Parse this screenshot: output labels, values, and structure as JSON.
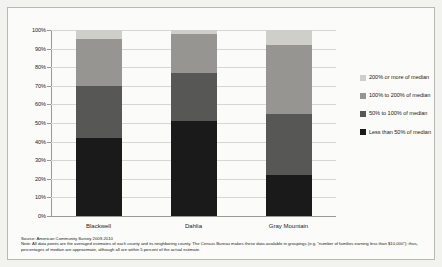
{
  "chart_data": {
    "type": "bar",
    "subtype": "stacked-bar-100-percent",
    "title": "",
    "xlabel": "",
    "ylabel": "",
    "ylim": [
      0,
      100
    ],
    "grid": true,
    "legend_position": "right",
    "categories": [
      "Blackwell",
      "Dahlia",
      "Gray Mountain"
    ],
    "tick_labels": [
      "0%",
      "10%",
      "20%",
      "30%",
      "40%",
      "50%",
      "60%",
      "70%",
      "80%",
      "90%",
      "100%"
    ],
    "tick_values": [
      0,
      10,
      20,
      30,
      40,
      50,
      60,
      70,
      80,
      90,
      100
    ],
    "series": [
      {
        "name": "Less than 50% of median",
        "color": "#1a1a1a",
        "values": [
          42,
          51,
          22
        ]
      },
      {
        "name": "50% to 100% of median",
        "color": "#575756",
        "values": [
          28,
          26,
          33
        ]
      },
      {
        "name": "100% to 200% of median",
        "color": "#969591",
        "values": [
          25,
          21,
          37
        ]
      },
      {
        "name": "200% or more of median",
        "color": "#cfcfca",
        "values": [
          5,
          2,
          8
        ]
      }
    ]
  },
  "legend": {
    "items": [
      {
        "label": "200% or more of median",
        "color": "#cfcfca"
      },
      {
        "label": "100% to 200% of median",
        "color": "#969591"
      },
      {
        "label": "50% to 100% of median",
        "color": "#575756"
      },
      {
        "label": "Less than 50% of median",
        "color": "#1a1a1a"
      }
    ]
  },
  "footnotes": {
    "source": "Source: American Community Survey  2009-2010",
    "note": "Note: All data points are the averaged estimates of each county and its neighboring county. The Census Bureau makes these data available in groupings (e.g. \"number of families earning less than $10,000\"); thus, percentages of median are approximate, although all are within 5 percent of the actual estimate."
  }
}
